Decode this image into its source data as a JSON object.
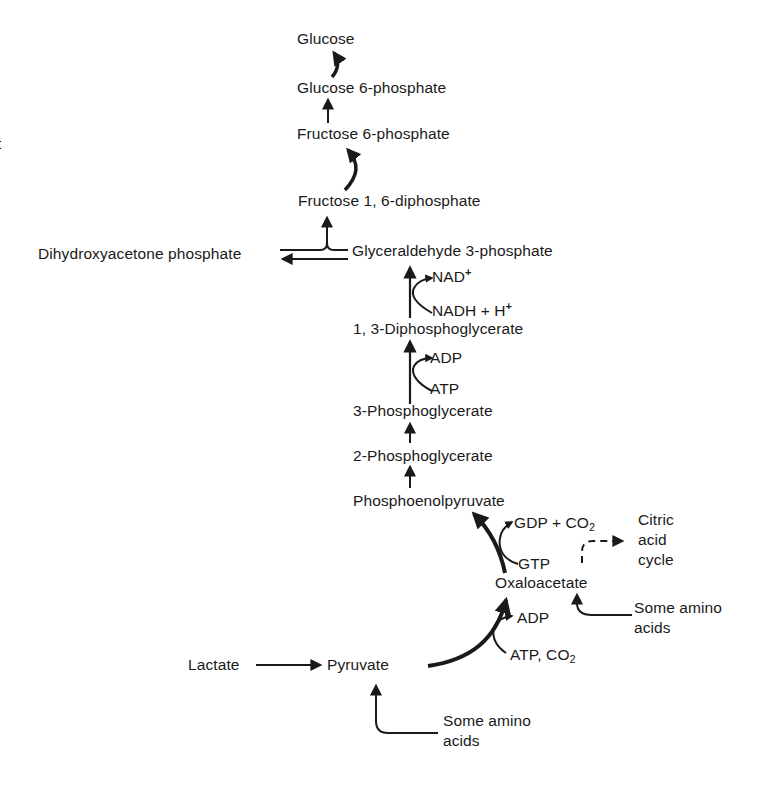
{
  "diagram": {
    "type": "metabolic-pathway",
    "stray_fragment": "t",
    "nodes": {
      "glucose": "Glucose",
      "glucose_6_phosphate": "Glucose 6-phosphate",
      "fructose_6_phosphate": "Fructose 6-phosphate",
      "fructose_1_6_diphosphate": "Fructose 1, 6-diphosphate",
      "dihydroxyacetone_phosphate": "Dihydroxyacetone phosphate",
      "glyceraldehyde_3_phosphate": "Glyceraldehyde 3-phosphate",
      "diphosphoglycerate_1_3": "1, 3-Diphosphoglycerate",
      "phosphoglycerate_3": "3-Phosphoglycerate",
      "phosphoglycerate_2": "2-Phosphoglycerate",
      "phosphoenolpyruvate": "Phosphoenolpyruvate",
      "oxaloacetate": "Oxaloacetate",
      "pyruvate": "Pyruvate",
      "lactate": "Lactate",
      "citric_acid_cycle": "Citric\nacid\ncycle",
      "amino_acids_oxaloacetate": "Some amino\nacids",
      "amino_acids_pyruvate": "Some amino\nacids"
    },
    "cofactors": {
      "nad_plus": {
        "base": "NAD",
        "sup": "+"
      },
      "nadh_h": {
        "base": "NADH + H",
        "sup": "+"
      },
      "adp_upper": "ADP",
      "atp_upper": "ATP",
      "gdp_co2": {
        "base": "GDP + CO",
        "sub": "2"
      },
      "gtp": "GTP",
      "adp_lower": "ADP",
      "atp_co2": {
        "base": "ATP, CO",
        "sub": "2"
      }
    },
    "edges": [
      {
        "from": "Glucose 6-phosphate",
        "to": "Glucose"
      },
      {
        "from": "Fructose 6-phosphate",
        "to": "Glucose 6-phosphate"
      },
      {
        "from": "Fructose 1, 6-diphosphate",
        "to": "Fructose 6-phosphate"
      },
      {
        "from": "Glyceraldehyde 3-phosphate",
        "to": "Fructose 1, 6-diphosphate"
      },
      {
        "from": "Dihydroxyacetone phosphate",
        "to": "Fructose 1, 6-diphosphate"
      },
      {
        "from": "Glyceraldehyde 3-phosphate",
        "to": "Dihydroxyacetone phosphate"
      },
      {
        "from": "1, 3-Diphosphoglycerate",
        "to": "Glyceraldehyde 3-phosphate",
        "cofactor_in": "NADH + H+",
        "cofactor_out": "NAD+"
      },
      {
        "from": "3-Phosphoglycerate",
        "to": "1, 3-Diphosphoglycerate",
        "cofactor_in": "ATP",
        "cofactor_out": "ADP"
      },
      {
        "from": "2-Phosphoglycerate",
        "to": "3-Phosphoglycerate"
      },
      {
        "from": "Phosphoenolpyruvate",
        "to": "2-Phosphoglycerate"
      },
      {
        "from": "Oxaloacetate",
        "to": "Phosphoenolpyruvate",
        "cofactor_in": "GTP",
        "cofactor_out": "GDP + CO2"
      },
      {
        "from": "Pyruvate",
        "to": "Oxaloacetate",
        "cofactor_in": "ATP, CO2",
        "cofactor_out": "ADP"
      },
      {
        "from": "Lactate",
        "to": "Pyruvate"
      },
      {
        "from": "Some amino acids",
        "to": "Pyruvate"
      },
      {
        "from": "Some amino acids",
        "to": "Oxaloacetate"
      },
      {
        "from": "Oxaloacetate",
        "to": "Citric acid cycle",
        "style": "dashed"
      }
    ]
  }
}
